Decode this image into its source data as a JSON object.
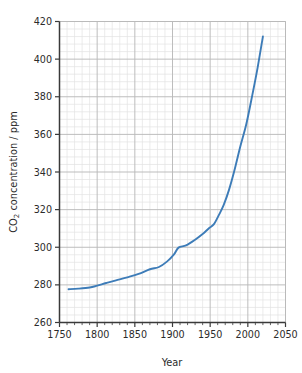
{
  "chart_data": {
    "type": "line",
    "title": "",
    "xlabel": "Year",
    "ylabel": "CO2 concentration / ppm",
    "ylabel_parts": {
      "pre": "CO",
      "sub": "2",
      "post": " concentration / ppm"
    },
    "xlim": [
      1750,
      2050
    ],
    "ylim": [
      260,
      420
    ],
    "x_major_step": 50,
    "x_minor_step": 10,
    "y_major_step": 20,
    "y_minor_step": 4,
    "grid": "major and minor gridlines, both axes",
    "legend": "none",
    "xticklabels": [
      "1750",
      "1800",
      "1850",
      "1900",
      "1950",
      "2000",
      "2050"
    ],
    "xtickvalues": [
      1750,
      1800,
      1850,
      1900,
      1950,
      2000,
      2050
    ],
    "yticklabels": [
      "260",
      "280",
      "300",
      "320",
      "340",
      "360",
      "380",
      "400",
      "420"
    ],
    "ytickvalues": [
      260,
      280,
      300,
      320,
      340,
      360,
      380,
      400,
      420
    ],
    "series": [
      {
        "name": "CO2 concentration",
        "color": "#3d7cb8",
        "line_width": 1.9,
        "x": [
          1762,
          1775,
          1790,
          1800,
          1812,
          1825,
          1840,
          1855,
          1870,
          1882,
          1893,
          1902,
          1908,
          1918,
          1930,
          1940,
          1948,
          1955,
          1962,
          1968,
          1975,
          1982,
          1990,
          1998,
          2006,
          2013,
          2020
        ],
        "values": [
          277.7,
          278.0,
          278.6,
          279.6,
          281.0,
          282.4,
          284.0,
          285.8,
          288.3,
          289.5,
          292.5,
          296.2,
          299.8,
          301.0,
          304.0,
          307.0,
          310.0,
          312.3,
          317.5,
          322.5,
          330.5,
          340.5,
          353.5,
          365.5,
          381.0,
          395.5,
          412.0
        ]
      }
    ],
    "data_note": "Monotonic rise from ~278 ppm (1760s) to ~412 ppm (2020); inflection near 1905 at ~300 ppm and a sharp knee near 1955 at ~312 ppm"
  },
  "axis": {
    "x_title": "Year",
    "y_title_pre": "CO",
    "y_title_sub": "2",
    "y_title_post": " concentration / ppm"
  },
  "style": {
    "background": "#ffffff",
    "axis_color": "#3a3a3a",
    "major_grid_color": "#b9b9b9",
    "minor_grid_color": "#e2e2e2",
    "line_color": "#3d7cb8",
    "tick_text_color": "#2b2b2b"
  }
}
